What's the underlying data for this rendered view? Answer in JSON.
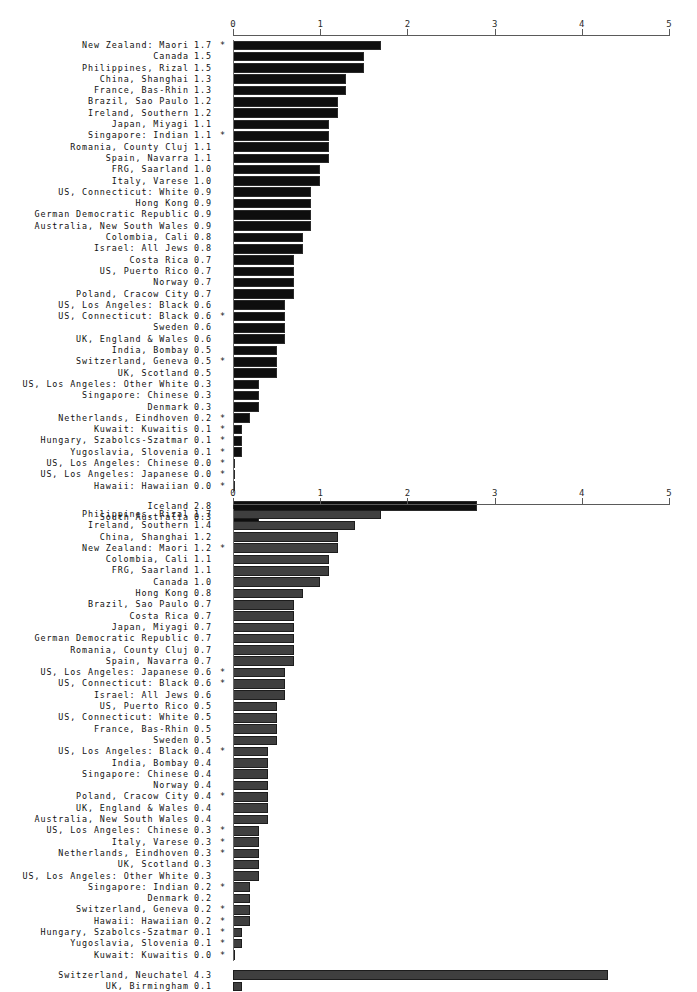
{
  "page": {
    "background": "#ffffff",
    "width": 697,
    "height": 961
  },
  "axis": {
    "ticks": [
      "0",
      "1",
      "2",
      "3",
      "4",
      "5"
    ],
    "min": 0,
    "max": 5,
    "x0_px": 233,
    "x5_px": 669,
    "footnote_marker": "*"
  },
  "chart_data": [
    {
      "id": "chart-1",
      "type": "bar",
      "orientation": "horizontal",
      "title": "",
      "xlabel": "",
      "ylabel": "",
      "xlim": [
        0,
        5
      ],
      "grid": false,
      "legend": "none",
      "bar_color": "#0e0e0e",
      "categories": [
        "New Zealand: Maori",
        "Canada",
        "Philippines, Rizal",
        "China, Shanghai",
        "France, Bas-Rhin",
        "Brazil, Sao Paulo",
        "Ireland, Southern",
        "Japan, Miyagi",
        "Singapore: Indian",
        "Romania, County Cluj",
        "Spain, Navarra",
        "FRG, Saarland",
        "Italy, Varese",
        "US, Connecticut: White",
        "Hong Kong",
        "German Democratic Republic",
        "Australia, New South Wales",
        "Colombia, Cali",
        "Israel: All Jews",
        "Costa Rica",
        "US, Puerto Rico",
        "Norway",
        "Poland, Cracow City",
        "US, Los Angeles: Black",
        "US, Connecticut: Black",
        "Sweden",
        "UK, England & Wales",
        "India, Bombay",
        "Switzerland, Geneva",
        "UK, Scotland",
        "US, Los Angeles: Other White",
        "Singapore: Chinese",
        "Denmark",
        "Netherlands, Eindhoven",
        "Kuwait: Kuwaitis",
        "Hungary, Szabolcs-Szatmar",
        "Yugoslavia, Slovenia",
        "US, Los Angeles: Chinese",
        "US, Los Angeles: Japanese",
        "Hawaii: Hawaiian"
      ],
      "values": [
        1.7,
        1.5,
        1.5,
        1.3,
        1.3,
        1.2,
        1.2,
        1.1,
        1.1,
        1.1,
        1.1,
        1.0,
        1.0,
        0.9,
        0.9,
        0.9,
        0.9,
        0.8,
        0.8,
        0.7,
        0.7,
        0.7,
        0.7,
        0.6,
        0.6,
        0.6,
        0.6,
        0.5,
        0.5,
        0.5,
        0.3,
        0.3,
        0.3,
        0.2,
        0.1,
        0.1,
        0.1,
        0.0,
        0.0,
        0.0
      ],
      "value_labels": [
        "1.7",
        "1.5",
        "1.5",
        "1.3",
        "1.3",
        "1.2",
        "1.2",
        "1.1",
        "1.1",
        "1.1",
        "1.1",
        "1.0",
        "1.0",
        "0.9",
        "0.9",
        "0.9",
        "0.9",
        "0.8",
        "0.8",
        "0.7",
        "0.7",
        "0.7",
        "0.7",
        "0.6",
        "0.6",
        "0.6",
        "0.6",
        "0.5",
        "0.5",
        "0.5",
        "0.3",
        "0.3",
        "0.3",
        "0.2",
        "0.1",
        "0.1",
        "0.1",
        "0.0",
        "0.0",
        "0.0"
      ],
      "starred": [
        true,
        false,
        false,
        false,
        false,
        false,
        false,
        false,
        true,
        false,
        false,
        false,
        false,
        false,
        false,
        false,
        false,
        false,
        false,
        false,
        false,
        false,
        false,
        false,
        true,
        false,
        false,
        false,
        true,
        false,
        false,
        false,
        false,
        true,
        true,
        true,
        true,
        true,
        true,
        true
      ],
      "extra_group": {
        "categories": [
          "Iceland",
          "South Australia"
        ],
        "values": [
          2.8,
          0.3
        ],
        "value_labels": [
          "2.8",
          "0.3"
        ],
        "starred": [
          false,
          false
        ]
      }
    },
    {
      "id": "chart-2",
      "type": "bar",
      "orientation": "horizontal",
      "title": "",
      "xlabel": "",
      "ylabel": "",
      "xlim": [
        0,
        5
      ],
      "grid": false,
      "legend": "none",
      "bar_color": "#3f3f3f",
      "categories": [
        "Philippines, Rizal",
        "Ireland, Southern",
        "China, Shanghai",
        "New Zealand: Maori",
        "Colombia, Cali",
        "FRG, Saarland",
        "Canada",
        "Hong Kong",
        "Brazil, Sao Paulo",
        "Costa Rica",
        "Japan, Miyagi",
        "German Democratic Republic",
        "Romania, County Cluj",
        "Spain, Navarra",
        "US, Los Angeles: Japanese",
        "US, Connecticut: Black",
        "Israel: All Jews",
        "US, Puerto Rico",
        "US, Connecticut: White",
        "France, Bas-Rhin",
        "Sweden",
        "US, Los Angeles: Black",
        "India, Bombay",
        "Singapore: Chinese",
        "Norway",
        "Poland, Cracow City",
        "UK, England & Wales",
        "Australia, New South Wales",
        "US, Los Angeles: Chinese",
        "Italy, Varese",
        "Netherlands, Eindhoven",
        "UK, Scotland",
        "US, Los Angeles: Other White",
        "Singapore: Indian",
        "Denmark",
        "Switzerland, Geneva",
        "Hawaii: Hawaiian",
        "Hungary, Szabolcs-Szatmar",
        "Yugoslavia, Slovenia",
        "Kuwait: Kuwaitis"
      ],
      "values": [
        1.7,
        1.4,
        1.2,
        1.2,
        1.1,
        1.1,
        1.0,
        0.8,
        0.7,
        0.7,
        0.7,
        0.7,
        0.7,
        0.7,
        0.6,
        0.6,
        0.6,
        0.5,
        0.5,
        0.5,
        0.5,
        0.4,
        0.4,
        0.4,
        0.4,
        0.4,
        0.4,
        0.4,
        0.3,
        0.3,
        0.3,
        0.3,
        0.3,
        0.2,
        0.2,
        0.2,
        0.2,
        0.1,
        0.1,
        0.0
      ],
      "value_labels": [
        "1.7",
        "1.4",
        "1.2",
        "1.2",
        "1.1",
        "1.1",
        "1.0",
        "0.8",
        "0.7",
        "0.7",
        "0.7",
        "0.7",
        "0.7",
        "0.7",
        "0.6",
        "0.6",
        "0.6",
        "0.5",
        "0.5",
        "0.5",
        "0.5",
        "0.4",
        "0.4",
        "0.4",
        "0.4",
        "0.4",
        "0.4",
        "0.4",
        "0.3",
        "0.3",
        "0.3",
        "0.3",
        "0.3",
        "0.2",
        "0.2",
        "0.2",
        "0.2",
        "0.1",
        "0.1",
        "0.0"
      ],
      "starred": [
        false,
        false,
        false,
        true,
        false,
        false,
        false,
        false,
        false,
        false,
        false,
        false,
        false,
        false,
        true,
        true,
        false,
        false,
        false,
        false,
        false,
        true,
        false,
        false,
        false,
        true,
        false,
        false,
        true,
        true,
        true,
        false,
        false,
        true,
        false,
        true,
        true,
        true,
        true,
        true
      ],
      "extra_group": {
        "categories": [
          "Switzerland, Neuchatel",
          "UK, Birmingham"
        ],
        "values": [
          4.3,
          0.1
        ],
        "value_labels": [
          "4.3",
          "0.1"
        ],
        "starred": [
          false,
          false
        ]
      }
    }
  ]
}
